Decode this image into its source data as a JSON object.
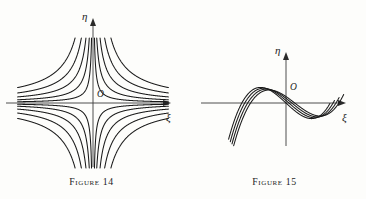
{
  "page": {
    "background_color": "#fdfdfb",
    "ink_color": "#1a1a1a"
  },
  "figures": [
    {
      "id": "figure-14",
      "caption_prefix": "Figure",
      "caption_number": "14",
      "caption_full": "Figure 14",
      "axis_x_label": "ξ",
      "axis_y_label": "η",
      "origin_label": "O",
      "curve_count": 20,
      "description": "Family of rectangular hyperbolas asymptotic to the ξ and η axes, four in each quadrant plus repeats"
    },
    {
      "id": "figure-15",
      "caption_prefix": "Figure",
      "caption_number": "15",
      "caption_full": "Figure 15",
      "axis_x_label": "ξ",
      "axis_y_label": "η",
      "origin_label": "O",
      "curve_count": 4,
      "description": "Family of cubic-shaped curves with a local maximum left of the η axis and a local minimum right of it"
    }
  ],
  "chart_data": [
    {
      "type": "line",
      "title": "Figure 14",
      "xlabel": "ξ",
      "ylabel": "η",
      "grid": false,
      "legend": "none",
      "xlim": [
        -1.55,
        1.55
      ],
      "ylim": [
        -1.25,
        1.25
      ],
      "family": "rectangular hyperbolas η = c / ξ",
      "constants": [
        0.035,
        0.09,
        0.17,
        0.28,
        0.43
      ],
      "branches_per_constant": 4,
      "annotations": [
        "O"
      ]
    },
    {
      "type": "line",
      "title": "Figure 15",
      "xlabel": "ξ",
      "ylabel": "η",
      "grid": false,
      "legend": "none",
      "xlim": [
        -2.3,
        2.3
      ],
      "ylim": [
        -1.3,
        1.3
      ],
      "family": "cubic curves η = ξ³ − 3ξ shifted horizontally",
      "shifts": [
        0.0,
        0.22,
        0.44,
        0.66
      ],
      "annotations": [
        "O"
      ]
    }
  ]
}
